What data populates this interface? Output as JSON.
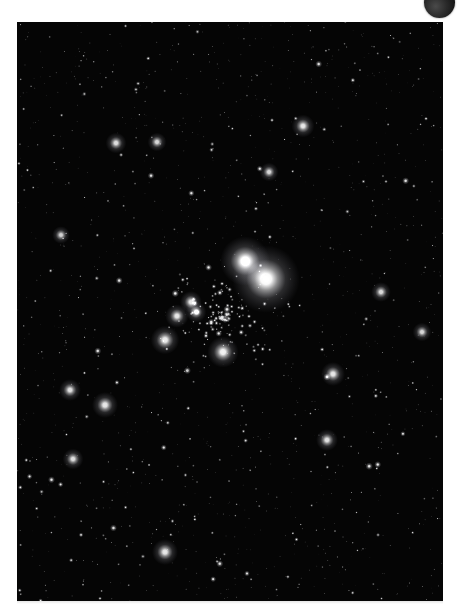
{
  "page": {
    "background_color": "#ffffff",
    "width": 460,
    "height": 615
  },
  "corner_ornament": {
    "name": "dark-disc",
    "shape": "circle",
    "color": "#2a2a2a",
    "center_x": 440,
    "center_y": 2,
    "radius": 15,
    "clipped_edge": "top"
  },
  "photo": {
    "title": "",
    "caption": "",
    "subject": "open star cluster",
    "frame": {
      "x": 17,
      "y": 22,
      "width": 426,
      "height": 579
    },
    "background_color": "#050505",
    "star_color": "#ffffff",
    "seed": 20240517,
    "background_star_count": 1400,
    "cluster": {
      "center_x": 205,
      "center_y": 296,
      "radius": 72,
      "member_count": 150
    },
    "bright_stars": [
      {
        "x": 228,
        "y": 239,
        "radius": 9.5,
        "brightness": 1.0
      },
      {
        "x": 249,
        "y": 257,
        "radius": 13.0,
        "brightness": 1.0
      },
      {
        "x": 206,
        "y": 330,
        "radius": 6.0,
        "brightness": 0.95
      },
      {
        "x": 148,
        "y": 318,
        "radius": 5.5,
        "brightness": 0.92
      },
      {
        "x": 160,
        "y": 294,
        "radius": 4.5,
        "brightness": 0.9
      },
      {
        "x": 174,
        "y": 280,
        "radius": 4.2,
        "brightness": 0.9
      },
      {
        "x": 179,
        "y": 290,
        "radius": 4.0,
        "brightness": 0.88
      },
      {
        "x": 88,
        "y": 383,
        "radius": 5.0,
        "brightness": 0.9
      },
      {
        "x": 148,
        "y": 530,
        "radius": 5.0,
        "brightness": 0.9
      },
      {
        "x": 53,
        "y": 368,
        "radius": 4.2,
        "brightness": 0.88
      },
      {
        "x": 286,
        "y": 104,
        "radius": 4.4,
        "brightness": 0.9
      },
      {
        "x": 56,
        "y": 437,
        "radius": 4.0,
        "brightness": 0.86
      },
      {
        "x": 316,
        "y": 352,
        "radius": 4.6,
        "brightness": 0.9
      },
      {
        "x": 310,
        "y": 418,
        "radius": 4.2,
        "brightness": 0.88
      },
      {
        "x": 99,
        "y": 121,
        "radius": 4.0,
        "brightness": 0.86
      },
      {
        "x": 364,
        "y": 270,
        "radius": 3.8,
        "brightness": 0.85
      },
      {
        "x": 252,
        "y": 150,
        "radius": 3.6,
        "brightness": 0.84
      },
      {
        "x": 140,
        "y": 120,
        "radius": 3.6,
        "brightness": 0.84
      },
      {
        "x": 405,
        "y": 310,
        "radius": 3.6,
        "brightness": 0.84
      },
      {
        "x": 44,
        "y": 213,
        "radius": 3.4,
        "brightness": 0.82
      }
    ]
  }
}
